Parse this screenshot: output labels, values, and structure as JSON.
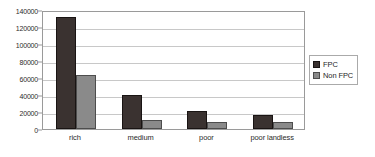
{
  "chart_data": {
    "type": "bar",
    "title": "",
    "subtitle": "",
    "xlabel": "",
    "ylabel": "",
    "categories": [
      "rich",
      "medium",
      "poor",
      "poor landless"
    ],
    "series": [
      {
        "name": "FPC",
        "color": "#3a3230",
        "values": [
          132000,
          40000,
          21500,
          17000
        ]
      },
      {
        "name": "Non FPC",
        "color": "#8a8a8a",
        "values": [
          64000,
          11000,
          8000,
          8000
        ]
      }
    ],
    "ylim": [
      0,
      140000
    ],
    "ytick_values": [
      0,
      20000,
      40000,
      60000,
      80000,
      100000,
      120000,
      140000
    ],
    "ytick_labels": [
      "0",
      "20000",
      "40000",
      "60000",
      "80000",
      "100000",
      "120000",
      "140000"
    ],
    "grid": true,
    "grid_axis": "y",
    "legend_position": "right",
    "legend_entries": [
      "FPC",
      "Non FPC"
    ],
    "annotations": [],
    "plot_border_color": "#9a9a9a",
    "gridline_color": "#c8c8c8",
    "background_color": "#ffffff"
  }
}
